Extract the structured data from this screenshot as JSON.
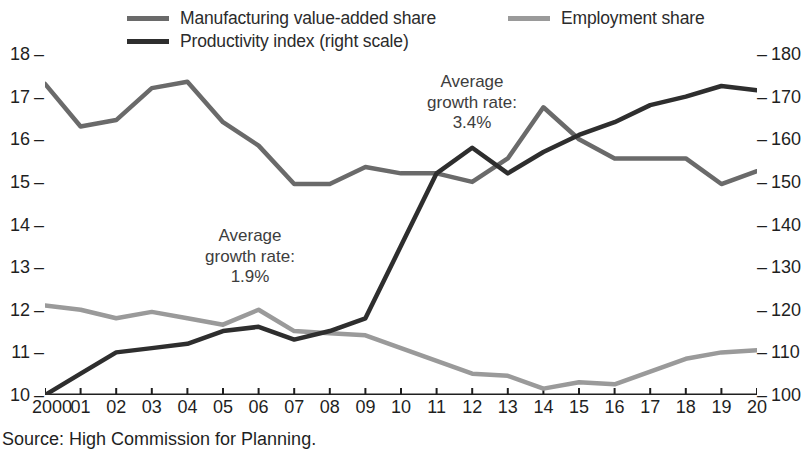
{
  "legend": {
    "items": [
      {
        "label": "Manufacturing value-added share",
        "color": "#6a6a6a",
        "key": "mva"
      },
      {
        "label": "Employment share",
        "color": "#9a9a9a",
        "key": "emp"
      },
      {
        "label": "Productivity index (right scale)",
        "color": "#2e2e2e",
        "key": "prod"
      }
    ]
  },
  "source": {
    "text": "Source: High Commission for Planning."
  },
  "annotations": [
    {
      "text": "Average\ngrowth rate:\n1.9%",
      "value": "1.9%"
    },
    {
      "text": "Average\ngrowth rate:\n3.4%",
      "value": "3.4%"
    }
  ],
  "axis": {
    "left_ticks": [
      "18",
      "17",
      "16",
      "15",
      "14",
      "13",
      "12",
      "11",
      "10"
    ],
    "right_ticks": [
      "180",
      "170",
      "160",
      "150",
      "140",
      "130",
      "120",
      "110",
      "100"
    ],
    "x_ticks": [
      "2000",
      "01",
      "02",
      "03",
      "04",
      "05",
      "06",
      "07",
      "08",
      "09",
      "10",
      "11",
      "12",
      "13",
      "14",
      "15",
      "16",
      "17",
      "18",
      "19",
      "20"
    ],
    "tick_dash": "–"
  },
  "chart_data": {
    "type": "line",
    "title": "",
    "subtitle": "",
    "xlabel": "",
    "ylabel": "",
    "y2label": "",
    "grid": false,
    "legend_position": "top",
    "x": [
      2000,
      2001,
      2002,
      2003,
      2004,
      2005,
      2006,
      2007,
      2008,
      2009,
      2010,
      2011,
      2012,
      2013,
      2014,
      2015,
      2016,
      2017,
      2018,
      2019,
      2020
    ],
    "categories": [
      "2000",
      "01",
      "02",
      "03",
      "04",
      "05",
      "06",
      "07",
      "08",
      "09",
      "10",
      "11",
      "12",
      "13",
      "14",
      "15",
      "16",
      "17",
      "18",
      "19",
      "20"
    ],
    "ylim": [
      10,
      18
    ],
    "y2lim": [
      100,
      180
    ],
    "yticks": [
      10,
      11,
      12,
      13,
      14,
      15,
      16,
      17,
      18
    ],
    "y2ticks": [
      100,
      110,
      120,
      130,
      140,
      150,
      160,
      170,
      180
    ],
    "series": [
      {
        "name": "Manufacturing value-added share",
        "key": "mva",
        "axis": "left",
        "color": "#6a6a6a",
        "width": 4.5,
        "values": [
          17.3,
          16.3,
          16.45,
          17.2,
          17.35,
          16.4,
          15.85,
          14.95,
          14.95,
          15.35,
          15.2,
          15.2,
          15.0,
          15.55,
          16.75,
          16.0,
          15.55,
          15.55,
          15.55,
          14.95,
          15.25
        ]
      },
      {
        "name": "Employment share",
        "key": "emp",
        "axis": "left",
        "color": "#9a9a9a",
        "width": 4.5,
        "values": [
          12.1,
          12.0,
          11.8,
          11.95,
          11.8,
          11.65,
          12.0,
          11.5,
          11.45,
          11.4,
          11.1,
          10.8,
          10.5,
          10.45,
          10.15,
          10.3,
          10.25,
          10.55,
          10.85,
          11.0,
          11.05
        ]
      },
      {
        "name": "Productivity index (right scale)",
        "key": "prod",
        "axis": "right",
        "color": "#2e2e2e",
        "width": 4.5,
        "values": [
          100,
          105,
          110,
          111,
          112,
          115,
          116,
          113,
          115,
          118,
          135,
          152,
          158,
          152,
          157,
          161,
          164,
          168,
          170,
          172.5,
          171.5
        ]
      }
    ],
    "annotations": [
      {
        "text": "Average growth rate: 1.9%",
        "x": 2005.2,
        "y": 13.1
      },
      {
        "text": "Average growth rate: 3.4%",
        "x": 2011.3,
        "y": 16.9
      }
    ]
  }
}
